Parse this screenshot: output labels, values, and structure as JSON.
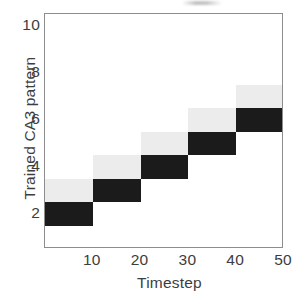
{
  "figure": {
    "name": "trained-ca3-pattern-heatmap",
    "background": "#ffffff",
    "axis_color": "#8d8d8d",
    "text_color": "#3d3d3d"
  },
  "chart_data": {
    "type": "heatmap",
    "title": "",
    "xlabel": "Timestep",
    "ylabel": "Trained CA3 pattern",
    "xlim": [
      0,
      50
    ],
    "ylim": [
      0.5,
      10.5
    ],
    "xticks": [
      10,
      20,
      30,
      40,
      50
    ],
    "yticks": [
      2,
      4,
      6,
      8,
      10
    ],
    "xticklabels": [
      "10",
      "20",
      "30",
      "40",
      "50"
    ],
    "yticklabels": [
      "2",
      "4",
      "6",
      "8",
      "10"
    ],
    "grid": false,
    "legend": "none",
    "colorscale": {
      "low": "#ffffff",
      "mid": "#ececec",
      "high": "#1b1b1b",
      "low_label": "0",
      "high_label": "1"
    },
    "cells": [
      {
        "timestep_bin": [
          0,
          10
        ],
        "pattern": 2,
        "value": 1.0,
        "shade": "#1b1b1b"
      },
      {
        "timestep_bin": [
          0,
          10
        ],
        "pattern": 3,
        "value": 0.08,
        "shade": "#ececec"
      },
      {
        "timestep_bin": [
          10,
          20
        ],
        "pattern": 3,
        "value": 1.0,
        "shade": "#1b1b1b"
      },
      {
        "timestep_bin": [
          10,
          20
        ],
        "pattern": 4,
        "value": 0.08,
        "shade": "#ececec"
      },
      {
        "timestep_bin": [
          20,
          30
        ],
        "pattern": 4,
        "value": 1.0,
        "shade": "#1b1b1b"
      },
      {
        "timestep_bin": [
          20,
          30
        ],
        "pattern": 5,
        "value": 0.08,
        "shade": "#ececec"
      },
      {
        "timestep_bin": [
          30,
          40
        ],
        "pattern": 5,
        "value": 1.0,
        "shade": "#1b1b1b"
      },
      {
        "timestep_bin": [
          30,
          40
        ],
        "pattern": 6,
        "value": 0.08,
        "shade": "#ececec"
      },
      {
        "timestep_bin": [
          40,
          50
        ],
        "pattern": 6,
        "value": 1.0,
        "shade": "#1b1b1b"
      },
      {
        "timestep_bin": [
          40,
          50
        ],
        "pattern": 7,
        "value": 0.08,
        "shade": "#ececec"
      }
    ]
  }
}
